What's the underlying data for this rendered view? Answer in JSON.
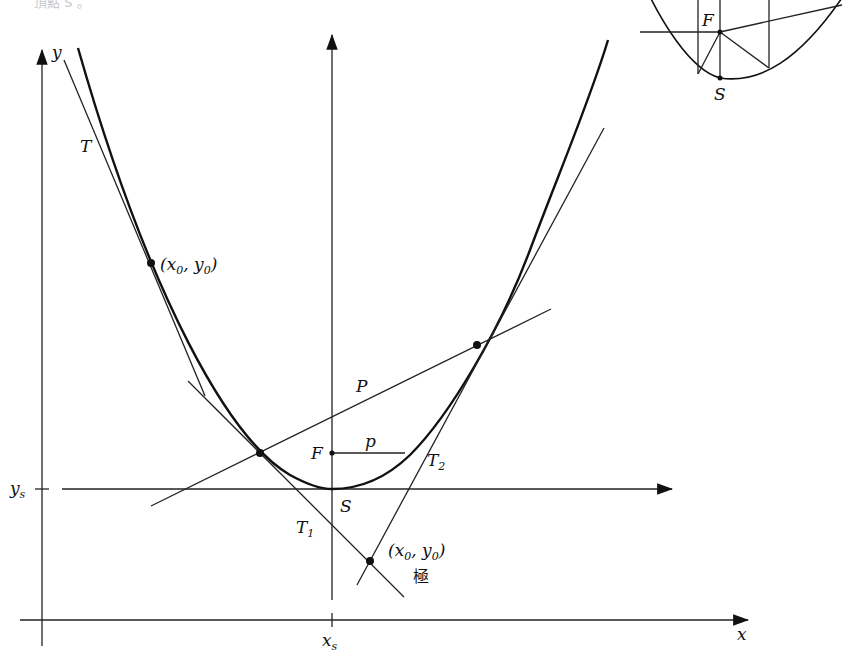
{
  "figure": {
    "title_fragment": "頂點 S 。",
    "main_diagram": {
      "axes": {
        "x_label": "x",
        "y_label": "y",
        "xs_label": "x",
        "xs_sub": "s",
        "ys_label": "y",
        "ys_sub": "s"
      },
      "curve": "parabola",
      "labels": {
        "tangent_T": "T",
        "tangent_T1": "T",
        "tangent_T1_sub": "1",
        "tangent_T2": "T",
        "tangent_T2_sub": "2",
        "polar_P": "P",
        "focus_F": "F",
        "vertex_S": "S",
        "param_p": "p",
        "point_upper": "(x",
        "point_upper_sub0": "0",
        "point_upper_mid": ", y",
        "point_upper_sub1": "0",
        "point_upper_end": ")",
        "pole_point": "(x",
        "pole_sub0": "0",
        "pole_mid": ", y",
        "pole_sub1": "0",
        "pole_end": ")",
        "pole_caption": "極"
      }
    },
    "inset_diagram": {
      "focus_label": "F",
      "vertex_label": "S"
    }
  }
}
